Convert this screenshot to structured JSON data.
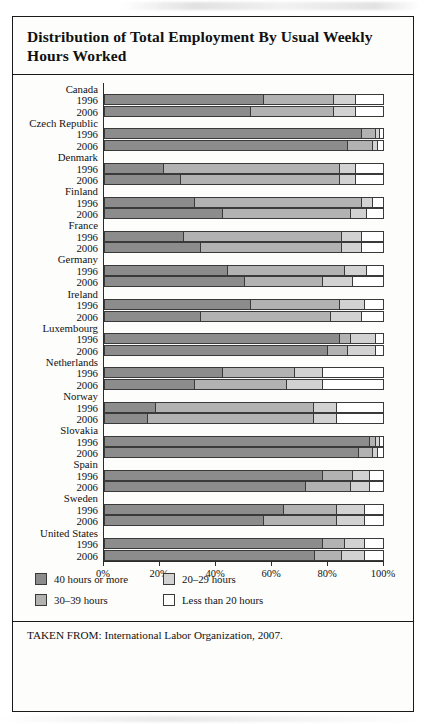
{
  "figure": {
    "title": "Distribution of Total Employment By Usual Weekly Hours Worked",
    "source": "TAKEN FROM: International Labor Organization, 2007."
  },
  "legend": {
    "items": [
      {
        "label": "40 hours or more",
        "color": "#8c8c8c"
      },
      {
        "label": "20–29 hours",
        "color": "#d2d2d2"
      },
      {
        "label": "30–39 hours",
        "color": "#b2b2b2"
      },
      {
        "label": "Less than 20 hours",
        "color": "#ffffff"
      }
    ]
  },
  "axis": {
    "ticks": [
      "0%",
      "20%",
      "40%",
      "60%",
      "80%",
      "100%"
    ],
    "tick_values": [
      0,
      20,
      40,
      60,
      80,
      100
    ]
  },
  "chart_data": {
    "type": "bar",
    "orientation": "horizontal",
    "stacked": true,
    "normalized_percent": true,
    "title": "Distribution of Total Employment By Usual Weekly Hours Worked",
    "xlabel": "",
    "ylabel": "",
    "xlim": [
      0,
      100
    ],
    "grid": false,
    "legend_position": "bottom-left",
    "series": [
      {
        "name": "40 hours or more",
        "color": "#8c8c8c"
      },
      {
        "name": "30–39 hours",
        "color": "#b2b2b2"
      },
      {
        "name": "20–29 hours",
        "color": "#d2d2d2"
      },
      {
        "name": "Less than 20 hours",
        "color": "#ffffff"
      }
    ],
    "groups": [
      {
        "country": "Canada",
        "rows": [
          {
            "year": "1996",
            "values": [
              57,
              25,
              8,
              10
            ]
          },
          {
            "year": "2006",
            "values": [
              52,
              30,
              8,
              10
            ]
          }
        ]
      },
      {
        "country": "Czech Republic",
        "rows": [
          {
            "year": "1996",
            "values": [
              92,
              5,
              1.5,
              1.5
            ]
          },
          {
            "year": "2006",
            "values": [
              87,
              9,
              2,
              2
            ]
          }
        ]
      },
      {
        "country": "Denmark",
        "rows": [
          {
            "year": "1996",
            "values": [
              21,
              63,
              6,
              10
            ]
          },
          {
            "year": "2006",
            "values": [
              27,
              57,
              6,
              10
            ]
          }
        ]
      },
      {
        "country": "Finland",
        "rows": [
          {
            "year": "1996",
            "values": [
              32,
              60,
              4,
              4
            ]
          },
          {
            "year": "2006",
            "values": [
              42,
              46,
              6,
              6
            ]
          }
        ]
      },
      {
        "country": "France",
        "rows": [
          {
            "year": "1996",
            "values": [
              28,
              57,
              7,
              8
            ]
          },
          {
            "year": "2006",
            "values": [
              34,
              51,
              7,
              8
            ]
          }
        ]
      },
      {
        "country": "Germany",
        "rows": [
          {
            "year": "1996",
            "values": [
              44,
              42,
              8,
              6
            ]
          },
          {
            "year": "2006",
            "values": [
              50,
              28,
              11,
              11
            ]
          }
        ]
      },
      {
        "country": "Ireland",
        "rows": [
          {
            "year": "1996",
            "values": [
              52,
              32,
              9,
              7
            ]
          },
          {
            "year": "2006",
            "values": [
              34,
              47,
              11,
              8
            ]
          }
        ]
      },
      {
        "country": "Luxembourg",
        "rows": [
          {
            "year": "1996",
            "values": [
              84,
              4,
              9,
              3
            ]
          },
          {
            "year": "2006",
            "values": [
              80,
              7,
              10,
              3
            ]
          }
        ]
      },
      {
        "country": "Netherlands",
        "rows": [
          {
            "year": "1996",
            "values": [
              42,
              26,
              10,
              22
            ]
          },
          {
            "year": "2006",
            "values": [
              32,
              33,
              13,
              22
            ]
          }
        ]
      },
      {
        "country": "Norway",
        "rows": [
          {
            "year": "1996",
            "values": [
              18,
              57,
              8,
              17
            ]
          },
          {
            "year": "2006",
            "values": [
              15,
              60,
              8,
              17
            ]
          }
        ]
      },
      {
        "country": "Slovakia",
        "rows": [
          {
            "year": "1996",
            "values": [
              95,
              2,
              1.5,
              1.5
            ]
          },
          {
            "year": "2006",
            "values": [
              91,
              5,
              2,
              2
            ]
          }
        ]
      },
      {
        "country": "Spain",
        "rows": [
          {
            "year": "1996",
            "values": [
              78,
              11,
              6,
              5
            ]
          },
          {
            "year": "2006",
            "values": [
              72,
              16,
              7,
              5
            ]
          }
        ]
      },
      {
        "country": "Sweden",
        "rows": [
          {
            "year": "1996",
            "values": [
              64,
              19,
              10,
              7
            ]
          },
          {
            "year": "2006",
            "values": [
              57,
              26,
              10,
              7
            ]
          }
        ]
      },
      {
        "country": "United States",
        "rows": [
          {
            "year": "1996",
            "values": [
              78,
              8,
              7,
              7
            ]
          },
          {
            "year": "2006",
            "values": [
              75,
              10,
              8,
              7
            ]
          }
        ]
      }
    ]
  }
}
